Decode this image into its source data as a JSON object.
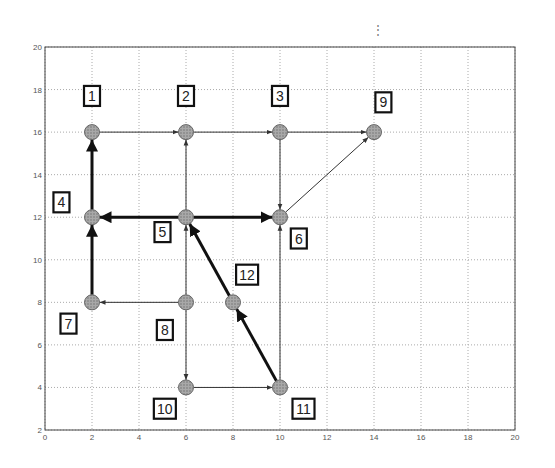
{
  "figure": {
    "x_ticks": [
      "0",
      "2",
      "4",
      "6",
      "8",
      "10",
      "12",
      "14",
      "16",
      "18",
      "20"
    ],
    "y_ticks": [
      "2",
      "4",
      "6",
      "8",
      "10",
      "12",
      "14",
      "16",
      "18",
      "20"
    ],
    "xlim": [
      0,
      20
    ],
    "ylim": [
      2,
      20
    ],
    "grid": true,
    "colors": {
      "node_fill": "#9a9a9a",
      "edge": "#333333",
      "grid": "#aaaaaa",
      "axes": "#444444"
    }
  },
  "nodes": [
    {
      "id": "1",
      "x": 2,
      "y": 16,
      "label_dx": 0,
      "label_dy": 1.7
    },
    {
      "id": "2",
      "x": 6,
      "y": 16,
      "label_dx": 0,
      "label_dy": 1.7
    },
    {
      "id": "3",
      "x": 10,
      "y": 16,
      "label_dx": 0,
      "label_dy": 1.7
    },
    {
      "id": "9",
      "x": 14,
      "y": 16,
      "label_dx": 0.4,
      "label_dy": 1.4
    },
    {
      "id": "4",
      "x": 2,
      "y": 12,
      "label_dx": -1.3,
      "label_dy": 0.7
    },
    {
      "id": "5",
      "x": 6,
      "y": 12,
      "label_dx": -1.0,
      "label_dy": -0.7
    },
    {
      "id": "6",
      "x": 10,
      "y": 12,
      "label_dx": 0.8,
      "label_dy": -1.0
    },
    {
      "id": "7",
      "x": 2,
      "y": 8,
      "label_dx": -1.0,
      "label_dy": -1.0
    },
    {
      "id": "8",
      "x": 6,
      "y": 8,
      "label_dx": -0.9,
      "label_dy": -1.3
    },
    {
      "id": "12",
      "x": 8,
      "y": 8,
      "label_dx": 0.6,
      "label_dy": 1.3
    },
    {
      "id": "10",
      "x": 6,
      "y": 4,
      "label_dx": -0.9,
      "label_dy": -1.0
    },
    {
      "id": "11",
      "x": 10,
      "y": 4,
      "label_dx": 1.0,
      "label_dy": -1.0
    }
  ],
  "edges": [
    {
      "from": "1",
      "to": "2",
      "bold": false
    },
    {
      "from": "2",
      "to": "3",
      "bold": false
    },
    {
      "from": "3",
      "to": "9",
      "bold": false
    },
    {
      "from": "3",
      "to": "6",
      "bold": false
    },
    {
      "from": "6",
      "to": "9",
      "bold": false
    },
    {
      "from": "5",
      "to": "2",
      "bold": false
    },
    {
      "from": "5",
      "to": "4",
      "bold": true
    },
    {
      "from": "5",
      "to": "6",
      "bold": true
    },
    {
      "from": "4",
      "to": "1",
      "bold": true
    },
    {
      "from": "7",
      "to": "4",
      "bold": true
    },
    {
      "from": "8",
      "to": "7",
      "bold": false
    },
    {
      "from": "8",
      "to": "5",
      "bold": false
    },
    {
      "from": "8",
      "to": "10",
      "bold": false
    },
    {
      "from": "10",
      "to": "11",
      "bold": false
    },
    {
      "from": "11",
      "to": "6",
      "bold": false
    },
    {
      "from": "11",
      "to": "12",
      "bold": true
    },
    {
      "from": "12",
      "to": "5",
      "bold": true
    }
  ],
  "misc": {
    "top_marker": "⋮"
  }
}
